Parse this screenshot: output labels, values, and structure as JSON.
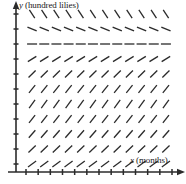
{
  "figure": {
    "title": "",
    "background": "#ffffff",
    "width": 186,
    "height": 184,
    "ink_color": "#2b2b2b"
  },
  "axes": {
    "y": {
      "label_var": "y",
      "label_units": "(hundred lilies)",
      "label_full": "y (hundred lilies)",
      "x_px": 16,
      "top_px": 6,
      "bottom_px": 172,
      "arrow": "up",
      "tick_count": 11,
      "tick_length_px": 5
    },
    "x": {
      "label_var": "x",
      "label_units": "(months)",
      "label_full": "x (months)",
      "y_px": 172,
      "left_px": 8,
      "right_px": 180,
      "arrow": "right",
      "tick_count": 13,
      "tick_length_px": 5
    }
  },
  "chart_data": {
    "type": "scatter",
    "plot_kind": "slope-field",
    "title": "",
    "xlabel": "x (months)",
    "ylabel": "y (hundred lilies)",
    "grid": false,
    "legend": null,
    "xlim": [
      0,
      12
    ],
    "ylim": [
      0,
      11
    ],
    "x": [
      1,
      2,
      3,
      4,
      5,
      6,
      7,
      8,
      9,
      10,
      11,
      12
    ],
    "y_rows": [
      10,
      9,
      8,
      7,
      6,
      5,
      4,
      3,
      2,
      1,
      0
    ],
    "note": "Direction field: slope depends only on y. Row at y=8 is the equilibrium (zero slope).",
    "equilibrium_row_y": 8,
    "row_slopes": [
      {
        "y": 10,
        "slope": -1.55,
        "description": "steep negative"
      },
      {
        "y": 9,
        "slope": -0.42,
        "description": "shallow negative"
      },
      {
        "y": 8,
        "slope": 0.0,
        "description": "zero / equilibrium"
      },
      {
        "y": 7,
        "slope": 0.62,
        "description": "positive"
      },
      {
        "y": 6,
        "slope": 1.0,
        "description": "positive"
      },
      {
        "y": 5,
        "slope": 1.25,
        "description": "steep positive"
      },
      {
        "y": 4,
        "slope": 1.35,
        "description": "steep positive"
      },
      {
        "y": 3,
        "slope": 1.3,
        "description": "steep positive"
      },
      {
        "y": 2,
        "slope": 1.15,
        "description": "positive"
      },
      {
        "y": 1,
        "slope": 0.95,
        "description": "positive"
      },
      {
        "y": 0,
        "slope": 0.72,
        "description": "positive"
      }
    ],
    "segment_half_length_px": 5,
    "columns": 12,
    "rows": 11
  }
}
